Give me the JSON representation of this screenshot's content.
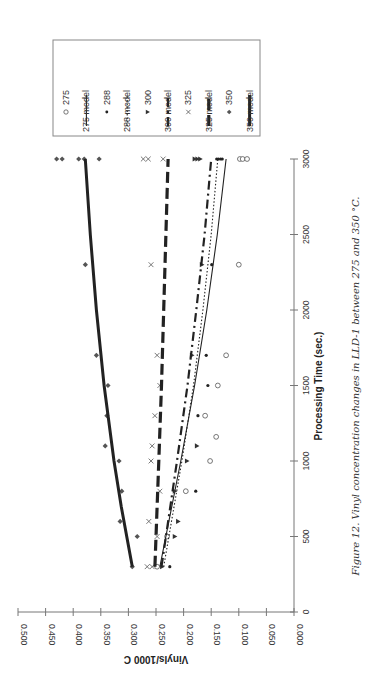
{
  "chart_data": {
    "type": "scatter",
    "orientation": "rotated-90-ccw",
    "title": "",
    "caption": "Figure 12. Vinyl concentration changes in LLD-1 between 275 and 350 °C.",
    "xlabel": "Processing Time (sec.)",
    "ylabel": "Vinyls/1000 C",
    "xlim": [
      0,
      3000
    ],
    "ylim": [
      0.0,
      0.5
    ],
    "x_ticks": [
      "0",
      "500",
      "1000",
      "1500",
      "2000",
      "2500",
      "3000"
    ],
    "y_ticks": [
      "0.000",
      "0.050",
      "0.100",
      "0.150",
      "0.200",
      "0.250",
      "0.300",
      "0.350",
      "0.400",
      "0.450",
      "0.500"
    ],
    "grid": false,
    "legend_position": "top-right (rotated)",
    "legend": [
      "275",
      "275 model",
      "288",
      "288 model",
      "300",
      "300 model",
      "325",
      "325 model",
      "350",
      "350 model"
    ],
    "series": [
      {
        "name": "275",
        "kind": "points",
        "marker": "open-circle",
        "x": [
          300,
          500,
          800,
          1000,
          1160,
          1300,
          1500,
          1700,
          2300,
          3000,
          3000,
          3000
        ],
        "y": [
          0.248,
          0.23,
          0.196,
          0.152,
          0.141,
          0.161,
          0.138,
          0.123,
          0.1,
          0.098,
          0.093,
          0.085
        ]
      },
      {
        "name": "275 model",
        "kind": "line",
        "style": "solid-thin",
        "x": [
          300,
          1000,
          1500,
          2000,
          2500,
          3000
        ],
        "y": [
          0.243,
          0.205,
          0.18,
          0.158,
          0.139,
          0.123
        ]
      },
      {
        "name": "288",
        "kind": "points",
        "marker": "filled-dot",
        "x": [
          300,
          800,
          1300,
          1500,
          1700,
          2300,
          3000,
          3000,
          3000,
          3000
        ],
        "y": [
          0.225,
          0.178,
          0.174,
          0.156,
          0.159,
          0.149,
          0.14,
          0.137,
          0.133,
          0.13
        ]
      },
      {
        "name": "288 model",
        "kind": "line",
        "style": "dotted",
        "x": [
          300,
          1000,
          1500,
          2000,
          2500,
          3000
        ],
        "y": [
          0.236,
          0.203,
          0.182,
          0.165,
          0.15,
          0.138
        ]
      },
      {
        "name": "300",
        "kind": "points",
        "marker": "filled-triangle",
        "x": [
          300,
          500,
          600,
          800,
          1000,
          1100,
          1700,
          2300,
          3000,
          3000,
          3000
        ],
        "y": [
          0.239,
          0.216,
          0.21,
          0.216,
          0.194,
          0.176,
          0.185,
          0.167,
          0.18,
          0.175,
          0.17
        ]
      },
      {
        "name": "300 model",
        "kind": "line",
        "style": "dash-dot",
        "x": [
          300,
          1000,
          1500,
          2000,
          2500,
          3000
        ],
        "y": [
          0.24,
          0.212,
          0.193,
          0.177,
          0.162,
          0.15
        ]
      },
      {
        "name": "325",
        "kind": "points",
        "marker": "x",
        "x": [
          300,
          300,
          500,
          600,
          800,
          1000,
          1100,
          1300,
          1500,
          1700,
          2300,
          3000,
          3000,
          3000
        ],
        "y": [
          0.266,
          0.257,
          0.248,
          0.263,
          0.243,
          0.259,
          0.257,
          0.252,
          0.243,
          0.248,
          0.259,
          0.273,
          0.264,
          0.237
        ]
      },
      {
        "name": "325 model",
        "kind": "line",
        "style": "long-dash",
        "x": [
          300,
          1000,
          1500,
          2000,
          2500,
          3000
        ],
        "y": [
          0.252,
          0.245,
          0.24,
          0.236,
          0.232,
          0.228
        ]
      },
      {
        "name": "350",
        "kind": "points",
        "marker": "filled-diamond",
        "x": [
          300,
          500,
          600,
          800,
          1000,
          1100,
          1300,
          1500,
          1700,
          2300,
          3000,
          3000,
          3000,
          3000,
          3000
        ],
        "y": [
          0.293,
          0.284,
          0.315,
          0.312,
          0.317,
          0.342,
          0.339,
          0.337,
          0.358,
          0.378,
          0.43,
          0.42,
          0.39,
          0.38,
          0.353
        ]
      },
      {
        "name": "350 model",
        "kind": "line",
        "style": "solid-thick",
        "x": [
          300,
          700,
          1000,
          1500,
          2000,
          2500,
          3000
        ],
        "y": [
          0.293,
          0.313,
          0.326,
          0.344,
          0.358,
          0.369,
          0.378
        ]
      }
    ]
  },
  "colors": {
    "background": "#ffffff",
    "ink": "#333333",
    "axis": "#777777",
    "legend_border": "#888888"
  }
}
